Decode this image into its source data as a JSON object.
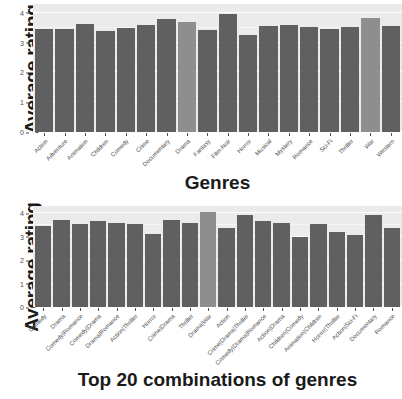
{
  "chart_data": [
    {
      "type": "bar",
      "panel": "top",
      "title": "",
      "xlabel": "Genres",
      "ylabel": "Average rating",
      "ylim": [
        0,
        4.3
      ],
      "yticks": [
        0,
        1,
        2,
        3,
        4
      ],
      "ytick_labels": [
        "0",
        "1",
        "2",
        "3",
        "4"
      ],
      "grid": true,
      "legend": "none",
      "bar_color": "#606060",
      "highlight_color": "#8e8e8e",
      "categories": [
        "Action",
        "Adventure",
        "Animation",
        "Children",
        "Comedy",
        "Crime",
        "Documentary",
        "Drama",
        "Fantasy",
        "Film-Noir",
        "Horror",
        "Musical",
        "Mystery",
        "Romance",
        "Sci-Fi",
        "Thriller",
        "War",
        "Western"
      ],
      "values": [
        3.45,
        3.45,
        3.62,
        3.4,
        3.49,
        3.6,
        3.78,
        3.68,
        3.44,
        3.96,
        3.26,
        3.57,
        3.59,
        3.54,
        3.45,
        3.52,
        3.83,
        3.56
      ],
      "highlighted": [
        "Drama",
        "War"
      ]
    },
    {
      "type": "bar",
      "panel": "bottom",
      "title": "",
      "xlabel": "Top 20 combinations of genres",
      "ylabel": "Average rating",
      "ylim": [
        0,
        4.3
      ],
      "yticks": [
        0,
        1,
        2,
        3,
        4
      ],
      "ytick_labels": [
        "0",
        "1",
        "2",
        "3",
        "4"
      ],
      "grid": true,
      "legend": "none",
      "bar_color": "#606060",
      "highlight_color": "#8e8e8e",
      "categories": [
        "Comedy",
        "Drama",
        "Comedy|Romance",
        "Comedy|Drama",
        "Drama|Romance",
        "Action|Thriller",
        "Horror",
        "Crime|Drama",
        "Thriller",
        "Drama|War",
        "Action",
        "Crime|Drama|Thriller",
        "Comedy|Drama|Romance",
        "Action|Drama",
        "Children|Comedy",
        "Animation|Children",
        "Horror|Thriller",
        "Action|Sci-Fi",
        "Documentary",
        "Romance"
      ],
      "values": [
        3.43,
        3.72,
        3.52,
        3.66,
        3.59,
        3.53,
        3.1,
        3.72,
        3.57,
        4.06,
        3.38,
        3.92,
        3.66,
        3.56,
        3.0,
        3.52,
        3.2,
        3.08,
        3.92,
        3.37
      ],
      "highlighted": [
        "Drama|War"
      ]
    }
  ],
  "panels": [
    {
      "ylabel": "Average rating",
      "xlabel": "Genres"
    },
    {
      "ylabel": "Average rating",
      "xlabel": "Top 20 combinations of genres"
    }
  ]
}
